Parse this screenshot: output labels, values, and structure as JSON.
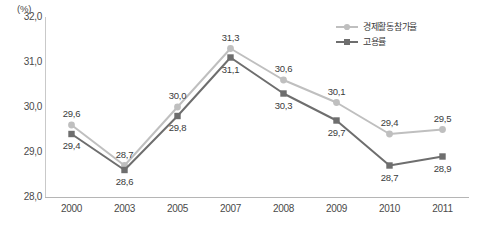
{
  "chart_data": {
    "type": "line",
    "title": "",
    "xlabel": "",
    "ylabel": "",
    "unit_label": "(%)",
    "categories": [
      "2000",
      "2003",
      "2005",
      "2007",
      "2008",
      "2009",
      "2010",
      "2011"
    ],
    "ylim": [
      28.0,
      32.0
    ],
    "yticks": [
      "28,0",
      "29,0",
      "30,0",
      "31,0",
      "32,0"
    ],
    "ytick_values": [
      28.0,
      29.0,
      30.0,
      31.0,
      32.0
    ],
    "grid": false,
    "legend_position": "top-right",
    "series": [
      {
        "name": "경제활동참가율",
        "color": "#bfbfbf",
        "marker": "circle",
        "values": [
          29.6,
          28.7,
          30.0,
          31.3,
          30.6,
          30.1,
          29.4,
          29.5
        ],
        "labels": [
          "29,6",
          "28,7",
          "30,0",
          "31,3",
          "30,6",
          "30,1",
          "29,4",
          "29,5"
        ],
        "label_side": [
          "above",
          "above",
          "above",
          "above",
          "above",
          "above",
          "above",
          "above"
        ]
      },
      {
        "name": "고용률",
        "color": "#6e6e6e",
        "marker": "square",
        "values": [
          29.4,
          28.6,
          29.8,
          31.1,
          30.3,
          29.7,
          28.7,
          28.9
        ],
        "labels": [
          "29,4",
          "28,6",
          "29,8",
          "31,1",
          "30,3",
          "29,7",
          "28,7",
          "28,9"
        ],
        "label_side": [
          "below",
          "below",
          "below",
          "below",
          "below",
          "below",
          "below",
          "below"
        ]
      }
    ]
  },
  "legend": {
    "items": [
      {
        "label": "경제활동참가율"
      },
      {
        "label": "고용률"
      }
    ]
  },
  "axis": {
    "unit": "(%)"
  }
}
